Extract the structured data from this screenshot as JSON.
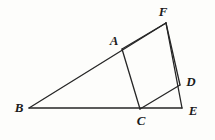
{
  "figure": {
    "kind": "geometry-diagram",
    "caption": "",
    "width": 215,
    "height": 140,
    "background_color": "#fdfdfb",
    "stroke_color": "#262626",
    "label_color": "#1b1b1b",
    "stroke_width": 1.3
  },
  "points": [
    {
      "id": "A",
      "label": "A",
      "x": 122,
      "y": 49,
      "label_x": 114,
      "label_y": 40
    },
    {
      "id": "B",
      "label": "B",
      "x": 29,
      "y": 108,
      "label_x": 19,
      "label_y": 107
    },
    {
      "id": "C",
      "label": "C",
      "x": 140,
      "y": 109,
      "label_x": 141,
      "label_y": 120
    },
    {
      "id": "D",
      "label": "D",
      "x": 180,
      "y": 85,
      "label_x": 191,
      "label_y": 81
    },
    {
      "id": "E",
      "label": "E",
      "x": 182,
      "y": 108,
      "label_x": 193,
      "label_y": 110
    },
    {
      "id": "F",
      "label": "F",
      "x": 166,
      "y": 23,
      "label_x": 163,
      "label_y": 11
    }
  ],
  "segments": [
    {
      "id": "BF",
      "from": "B",
      "to": "F",
      "name": "segment-b-f"
    },
    {
      "id": "BE",
      "from": "B",
      "to": "E",
      "name": "segment-b-e"
    },
    {
      "id": "FE",
      "from": "F",
      "to": "E",
      "name": "segment-f-e"
    },
    {
      "id": "AC",
      "from": "A",
      "to": "C",
      "name": "segment-a-c"
    },
    {
      "id": "AF",
      "from": "A",
      "to": "F",
      "name": "segment-a-f"
    },
    {
      "id": "CD",
      "from": "C",
      "to": "D",
      "name": "segment-c-d"
    },
    {
      "id": "FD",
      "from": "F",
      "to": "D",
      "name": "segment-f-d"
    }
  ]
}
